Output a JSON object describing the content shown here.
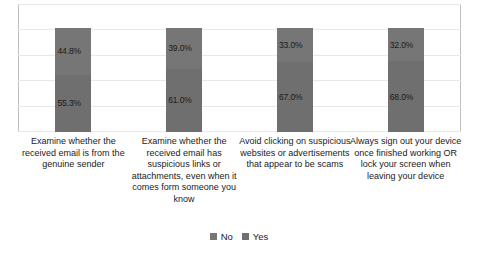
{
  "chart_data": {
    "type": "bar",
    "subtype": "stacked-100-percent",
    "title": "",
    "subtitle": "",
    "xlabel": "",
    "ylabel": "",
    "ylim": [
      0,
      100
    ],
    "grid": true,
    "gridline_values": [
      0,
      20,
      40,
      60,
      80,
      100
    ],
    "legend_position": "bottom-center",
    "orientation": "vertical",
    "value_suffix": "%",
    "categories": [
      "Examine whether the received email is from the genuine sender",
      "Examine whether the received email has suspicious links or attachments, even when it comes form someone you know",
      "Avoid clicking on suspicious websites or advertisements that appear to be scams",
      "Always sign out your device once finished working OR lock your screen when leaving your device"
    ],
    "series": [
      {
        "name": "No",
        "color": "#767676",
        "values": [
          44.8,
          39.0,
          33.0,
          32.0
        ],
        "labels": [
          "44.8%",
          "39.0%",
          "33.0%",
          "32.0%"
        ]
      },
      {
        "name": "Yes",
        "color": "#6f6f6f",
        "values": [
          55.3,
          61.0,
          67.0,
          68.0
        ],
        "labels": [
          "55.3%",
          "61.0%",
          "67.0%",
          "68.0%"
        ]
      }
    ]
  },
  "legend": {
    "items": [
      {
        "label": "No",
        "color": "#767676"
      },
      {
        "label": "Yes",
        "color": "#6f6f6f"
      }
    ]
  },
  "colors": {
    "background": "#ffffff",
    "gridline": "#e8e8e8",
    "axis": "#bdbdbd",
    "text": "#1a1a1a",
    "series_no": "#767676",
    "series_yes": "#6f6f6f"
  }
}
